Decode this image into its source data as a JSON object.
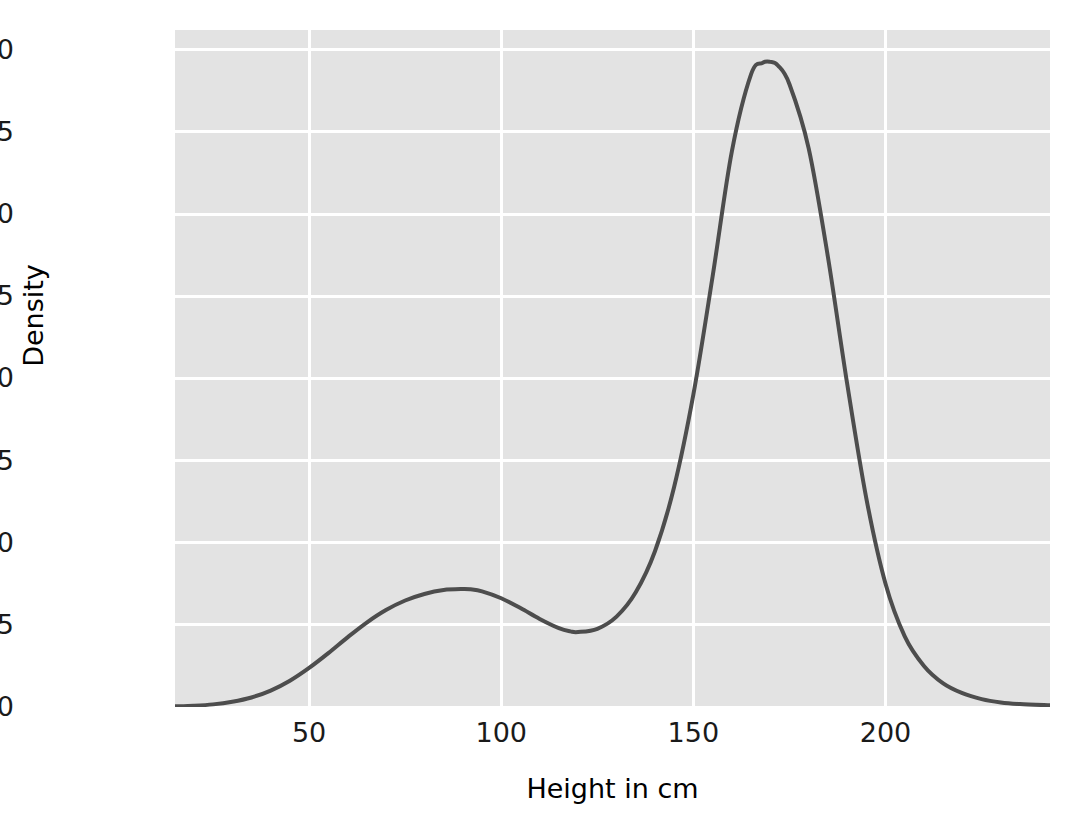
{
  "chart_data": {
    "type": "line",
    "title": "",
    "xlabel": "Height in cm",
    "ylabel": "Density",
    "grid": true,
    "legend": false,
    "xlim": [
      15.1,
      242.8
    ],
    "ylim": [
      0.0,
      0.0206
    ],
    "xticks": [
      50,
      100,
      150,
      200
    ],
    "xtick_labels": [
      "50",
      "100",
      "150",
      "200"
    ],
    "yticks": [
      0.0,
      0.0025,
      0.005,
      0.0075,
      0.01,
      0.0125,
      0.015,
      0.0175,
      0.02
    ],
    "ytick_labels": [
      "0.0000",
      "0.0025",
      "0.0050",
      "0.0075",
      "0.0100",
      "0.0125",
      "0.0150",
      "0.0175",
      "0.0200"
    ],
    "series": [
      {
        "name": "density",
        "color": "#4d4d4d",
        "linewidth": 4,
        "x": [
          15.1,
          20,
          25,
          30,
          35,
          40,
          45,
          50,
          55,
          60,
          65,
          70,
          75,
          80,
          85,
          90,
          92,
          95,
          100,
          105,
          110,
          115,
          118,
          120,
          125,
          130,
          135,
          140,
          145,
          150,
          155,
          160,
          165,
          168,
          170,
          172,
          175,
          180,
          185,
          190,
          195,
          200,
          205,
          210,
          215,
          220,
          225,
          230,
          235,
          242.8
        ],
        "y": [
          2e-05,
          4e-05,
          8e-05,
          0.00016,
          0.00029,
          0.0005,
          0.0008,
          0.00119,
          0.00164,
          0.00212,
          0.00257,
          0.00295,
          0.00324,
          0.00344,
          0.00356,
          0.00359,
          0.00358,
          0.00352,
          0.00331,
          0.00301,
          0.00268,
          0.0024,
          0.0023,
          0.00228,
          0.00238,
          0.00275,
          0.00349,
          0.00474,
          0.0067,
          0.00951,
          0.0131,
          0.0169,
          0.01925,
          0.0196,
          0.01963,
          0.01952,
          0.01895,
          0.017,
          0.0137,
          0.00985,
          0.00635,
          0.00375,
          0.00215,
          0.00125,
          0.00072,
          0.00042,
          0.00024,
          0.00014,
          9e-05,
          5e-05
        ]
      }
    ],
    "annotations": {
      "primary_peak": {
        "x": 170,
        "y": 0.01963
      },
      "secondary_peak": {
        "x": 92,
        "y": 0.00359
      },
      "local_minimum": {
        "x": 119,
        "y": 0.00228
      }
    },
    "style": {
      "plot_background": "#e3e3e3",
      "grid_color": "#ffffff",
      "figure_background": "#ffffff",
      "tick_label_color": "#1a1a1a",
      "axis_label_color": "#000000"
    }
  }
}
